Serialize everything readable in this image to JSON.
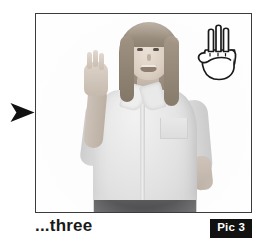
{
  "page": {
    "background_color": "#ffffff",
    "width": 268,
    "height": 245
  },
  "pointer": {
    "icon": "right-arrow-pointer",
    "color": "#111111",
    "direction": "right"
  },
  "picture": {
    "frame_border_color": "#3c3c3c",
    "photo": {
      "description": "Grayscale photo of a woman signing the number three",
      "alt": "Woman in light button-up shirt holding up three fingers",
      "rendering": "grayscale"
    },
    "handshape": {
      "icon": "hand-three-fingers-icon",
      "label": "three",
      "fingers_extended": 3,
      "stroke_color": "#1a1a1a",
      "fill_color": "#ffffff"
    }
  },
  "caption": {
    "text": "...three",
    "color": "#1a1a1a"
  },
  "badge": {
    "label": "Pic 3",
    "background_color": "#111111",
    "text_color": "#ffffff"
  }
}
